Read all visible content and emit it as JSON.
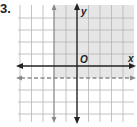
{
  "problem": {
    "number": "3."
  },
  "graph": {
    "x_label": "x",
    "y_label": "y",
    "origin_label": "O",
    "grid": {
      "x_min": -5,
      "x_max": 5,
      "y_min": -5,
      "y_max": 5,
      "spacing_px": 11.4
    },
    "boundaries": [
      {
        "name": "vertical-boundary",
        "equation": "x = -2",
        "style": "solid",
        "color": "#8a8a8a"
      },
      {
        "name": "horizontal-boundary",
        "equation": "y = -1",
        "style": "dashed",
        "color": "#8a8a8a"
      }
    ],
    "shaded_region": {
      "description": "x >= -2 and y > -1",
      "color": "#e6e6e6"
    },
    "colors": {
      "grid": "#b5b5b5",
      "axis": "#222222",
      "boundary": "#8a8a8a",
      "shade": "#e6e6e6"
    }
  }
}
